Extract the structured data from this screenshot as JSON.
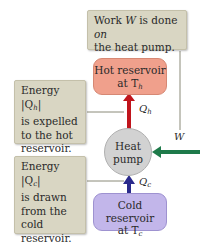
{
  "diagram": {
    "work_callout": {
      "text_line1_pre": "Work ",
      "text_var": "W",
      "text_line1_mid": " is done ",
      "text_on": "on",
      "text_line2": "the heat pump."
    },
    "hot_callout": {
      "line1": "Energy |Q",
      "line1_sub": "h",
      "line1_end": "|",
      "line2": "is expelled",
      "line3": "to the hot",
      "line4": "reservoir."
    },
    "cold_callout": {
      "line1": "Energy |Q",
      "line1_sub": "c",
      "line1_end": "|",
      "line2": "is drawn",
      "line3": "from the",
      "line4": "cold",
      "line5": "reservoir."
    },
    "hot_reservoir": {
      "line1": "Hot reservoir",
      "line2": "at T",
      "line2_sub": "h"
    },
    "cold_reservoir": {
      "line1": "Cold reservoir",
      "line2": "at T",
      "line2_sub": "c"
    },
    "heat_pump": {
      "line1": "Heat",
      "line2": "pump"
    },
    "arrow_labels": {
      "qh": "Q",
      "qh_sub": "h",
      "qc": "Q",
      "qc_sub": "c",
      "w": "W"
    },
    "colors": {
      "hot_arrow": "#c0141c",
      "cold_arrow": "#2a2a8c",
      "work_arrow": "#1e7a4a",
      "hot_box": "#f0a08c",
      "cold_box": "#c2b6ea",
      "callout": "#d9d6c3",
      "pump": "#d2d2d2",
      "connector": "#8a8a78"
    }
  }
}
